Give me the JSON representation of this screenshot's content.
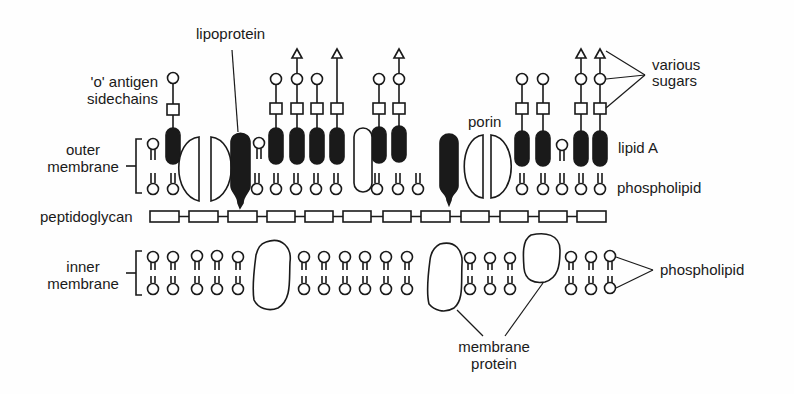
{
  "diagram": {
    "labels": {
      "lipoprotein": "lipoprotein",
      "o_antigen_line1": "'o' antigen",
      "o_antigen_line2": "sidechains",
      "outer_membrane_line1": "outer",
      "outer_membrane_line2": "membrane",
      "various_sugars_line1": "various",
      "various_sugars_line2": "sugars",
      "porin": "porin",
      "lipid_a": "lipid A",
      "phospholipid_outer": "phospholipid",
      "peptidoglycan": "peptidoglycan",
      "inner_membrane_line1": "inner",
      "inner_membrane_line2": "membrane",
      "phospholipid_inner": "phospholipid",
      "membrane_protein_line1": "membrane",
      "membrane_protein_line2": "protein"
    },
    "colors": {
      "ink": "#1a1a1a",
      "background": "#fefefe"
    }
  }
}
